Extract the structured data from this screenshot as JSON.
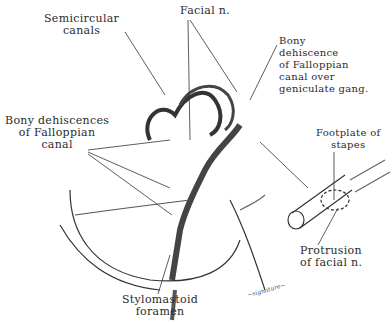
{
  "labels": {
    "semicircular_canals": "Semicircular\ncanals",
    "facial_nerve": "Facial n.",
    "bony_dehiscence_geniculate": "Bony\ndehiscence\nof Falloppian\ncanal over\ngeniculate gang.",
    "bony_dehiscences_canal": "Bony dehiscences\nof Falloppian\ncanal",
    "footplate_stapes": "Footplate of\nstapes",
    "protrusion_facial": "Protrusion\nof facial n.",
    "stylomastoid_foramen": "Stylomastoid\nforamen"
  },
  "signature": "signature"
}
